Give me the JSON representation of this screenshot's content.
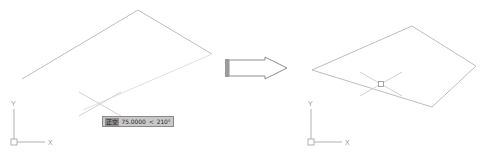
{
  "app": {
    "kind": "cad-drawing-viewport",
    "background_color": "#ffffff",
    "geometry_color": "#b8b8b8",
    "cursor_color": "#cfcfcf",
    "ucs_color": "#a8a8a8",
    "arrow_outline_color": "#8d8d8d",
    "arrow_tail_color": "#9b9b9b"
  },
  "left_panel": {
    "name": "before-state",
    "shape_name": "open-polyline",
    "vertices": [
      {
        "x": 22,
        "y": 79
      },
      {
        "x": 138,
        "y": 10
      },
      {
        "x": 212,
        "y": 54
      }
    ],
    "rubber_band": {
      "x1": 212,
      "y1": 54,
      "x2": 83,
      "y2": 110
    },
    "crosshair": {
      "name": "rotated-crosshair-cursor",
      "cx": 100,
      "cy": 104,
      "arm": 24,
      "angle_deg": 30
    },
    "ucs_icon": {
      "name": "ucs-icon",
      "origin_x": 14,
      "origin_y": 142,
      "x_label": "X",
      "y_label": "Y",
      "x_len": 30,
      "y_len": 33
    },
    "dynamic_input": {
      "name": "dynamic-input-tooltip",
      "mode_label": "正交",
      "distance_value": "75.0000",
      "angle_separator": "<",
      "angle_value": "210°",
      "full_text": "正交  75.0000 < 210°"
    }
  },
  "transition": {
    "name": "transition-arrow",
    "label": "",
    "x": 225,
    "y": 57,
    "width": 62,
    "height": 22,
    "direction": "right"
  },
  "right_panel": {
    "name": "after-state",
    "shape_name": "closed-parallelogram",
    "vertices": [
      {
        "x": 169,
        "y": 26
      },
      {
        "x": 233,
        "y": 66
      },
      {
        "x": 189,
        "y": 107
      },
      {
        "x": 69,
        "y": 70
      }
    ],
    "crosshair": {
      "name": "rotated-crosshair-cursor",
      "cx": 138,
      "cy": 84,
      "arm": 24,
      "angle_deg": 30,
      "pickbox_size": 5
    },
    "ucs_icon": {
      "name": "ucs-icon",
      "origin_x": 68,
      "origin_y": 142,
      "x_label": "X",
      "y_label": "Y",
      "x_len": 30,
      "y_len": 33
    }
  }
}
